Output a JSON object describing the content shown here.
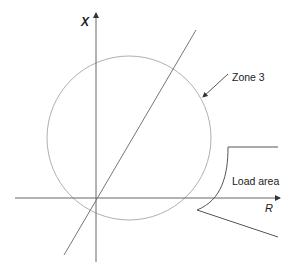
{
  "diagram": {
    "axes": {
      "x_axis_label": "R",
      "y_axis_label": "X"
    },
    "annotations": {
      "zone_label": "Zone 3",
      "load_area_label": "Load area"
    },
    "elements": [
      {
        "type": "circle",
        "name": "Zone 3 mho characteristic"
      },
      {
        "type": "line",
        "name": "line impedance angle"
      },
      {
        "type": "region",
        "name": "Load area"
      }
    ],
    "colors": {
      "axis": "#555555",
      "circle": "#aaaaaa",
      "line": "#666666"
    }
  }
}
